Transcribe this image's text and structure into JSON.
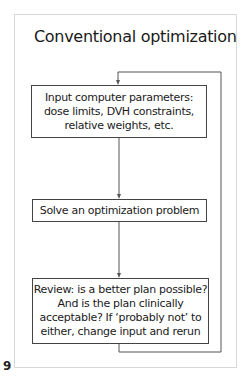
{
  "diagram": {
    "title": "Conventional optimization",
    "nodes": [
      {
        "id": "input",
        "lines": [
          "Input computer parameters:",
          "dose limits, DVH constraints,",
          "relative weights, etc."
        ]
      },
      {
        "id": "solve",
        "lines": [
          "Solve an optimization problem"
        ]
      },
      {
        "id": "review",
        "lines": [
          "Review:  is a better plan possible?",
          "And is the plan clinically",
          "acceptable?  If ‘probably not’ to",
          "either, change input and rerun"
        ]
      }
    ],
    "edges": [
      {
        "from": "input",
        "to": "solve"
      },
      {
        "from": "solve",
        "to": "review"
      },
      {
        "from": "review",
        "to": "input",
        "type": "feedback-loop"
      }
    ]
  },
  "page": {
    "number": "9"
  },
  "colors": {
    "frame_border": "#d8d8d8",
    "box_border": "#444444",
    "text": "#1a1a1a"
  }
}
